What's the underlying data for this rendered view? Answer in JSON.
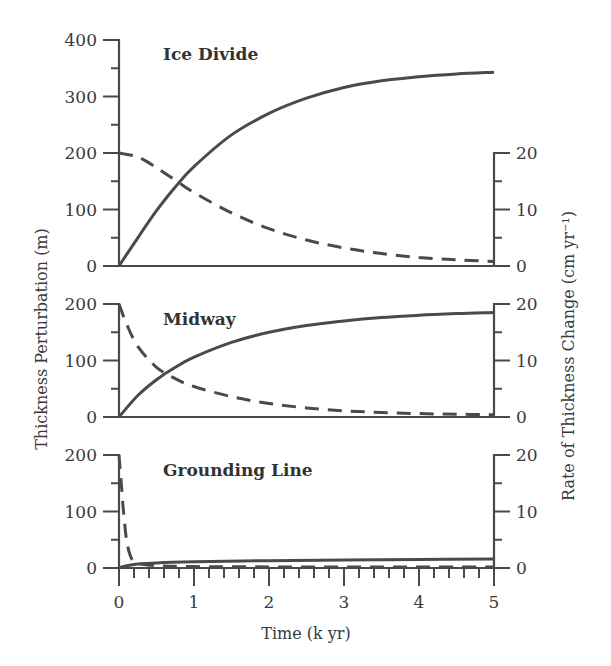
{
  "chart_data": {
    "type": "line",
    "xlabel": "Time (k yr)",
    "ylabel_left": "Thickness Perturbation (m)",
    "ylabel_right": "Rate of Thickness Change (cm yr⁻¹)",
    "xlim": [
      0,
      5
    ],
    "x_ticks": [
      "0",
      "1",
      "2",
      "3",
      "4",
      "5"
    ],
    "x_minor_step": 0.2,
    "grid": false,
    "legend": "none (solid = thickness perturbation, left axis; dashed = rate of thickness change, right axis)",
    "panels": [
      {
        "title": "Ice Divide",
        "ylim_left": [
          0,
          400
        ],
        "left_ticks": [
          "0",
          "100",
          "200",
          "300",
          "400"
        ],
        "left_minor_step": 50,
        "ylim_right": [
          0,
          20
        ],
        "right_ticks": [
          "0",
          "10",
          "20"
        ],
        "right_minor_step": 5,
        "series": [
          {
            "name": "Thickness Perturbation",
            "axis": "left",
            "style": "solid",
            "x": [
              0,
              0.25,
              0.5,
              0.75,
              1.0,
              1.5,
              2.0,
              2.5,
              3.0,
              3.5,
              4.0,
              4.5,
              5.0
            ],
            "y": [
              0,
              50,
              98,
              140,
              176,
              232,
              270,
              297,
              316,
              328,
              335,
              340,
              343
            ]
          },
          {
            "name": "Rate of Thickness Change",
            "axis": "right",
            "style": "dashed",
            "x": [
              0,
              0.25,
              0.5,
              0.75,
              1.0,
              1.5,
              2.0,
              2.5,
              3.0,
              3.5,
              4.0,
              4.5,
              5.0
            ],
            "y": [
              20,
              19.3,
              17.4,
              15.2,
              13.0,
              9.4,
              6.6,
              4.6,
              3.2,
              2.2,
              1.5,
              1.1,
              0.8
            ]
          }
        ]
      },
      {
        "title": "Midway",
        "ylim_left": [
          0,
          200
        ],
        "left_ticks": [
          "0",
          "100",
          "200"
        ],
        "left_minor_step": 50,
        "ylim_right": [
          0,
          20
        ],
        "right_ticks": [
          "0",
          "10",
          "20"
        ],
        "right_minor_step": 5,
        "series": [
          {
            "name": "Thickness Perturbation",
            "axis": "left",
            "style": "solid",
            "x": [
              0,
              0.25,
              0.5,
              0.75,
              1.0,
              1.5,
              2.0,
              2.5,
              3.0,
              3.5,
              4.0,
              4.5,
              5.0
            ],
            "y": [
              0,
              38,
              66,
              88,
              106,
              132,
              150,
              162,
              170,
              176,
              180,
              183,
              185
            ]
          },
          {
            "name": "Rate of Thickness Change",
            "axis": "right",
            "style": "dashed",
            "x": [
              0,
              0.1,
              0.25,
              0.5,
              0.75,
              1.0,
              1.5,
              2.0,
              2.5,
              3.0,
              3.5,
              4.0,
              4.5,
              5.0
            ],
            "y": [
              20,
              16.5,
              12.5,
              8.8,
              6.8,
              5.4,
              3.6,
              2.4,
              1.6,
              1.1,
              0.8,
              0.6,
              0.5,
              0.4
            ]
          }
        ]
      },
      {
        "title": "Grounding Line",
        "ylim_left": [
          0,
          200
        ],
        "left_ticks": [
          "0",
          "100",
          "200"
        ],
        "left_minor_step": 50,
        "ylim_right": [
          0,
          20
        ],
        "right_ticks": [
          "0",
          "10",
          "20"
        ],
        "right_minor_step": 5,
        "series": [
          {
            "name": "Thickness Perturbation",
            "axis": "left",
            "style": "solid",
            "x": [
              0,
              0.1,
              0.25,
              0.5,
              1.0,
              2.0,
              3.0,
              4.0,
              5.0
            ],
            "y": [
              0,
              4,
              7,
              9,
              11,
              13,
              14,
              15,
              16
            ]
          },
          {
            "name": "Rate of Thickness Change",
            "axis": "right",
            "style": "dashed",
            "x": [
              0,
              0.03,
              0.06,
              0.1,
              0.15,
              0.2,
              0.3,
              0.5,
              1.0,
              2.0,
              3.0,
              4.0,
              5.0
            ],
            "y": [
              20,
              15,
              10,
              5,
              2.2,
              1.2,
              0.7,
              0.4,
              0.25,
              0.2,
              0.2,
              0.2,
              0.2
            ]
          }
        ]
      }
    ]
  }
}
